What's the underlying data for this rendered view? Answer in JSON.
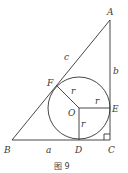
{
  "diagram": {
    "caption": "图 9",
    "points": {
      "A": {
        "label": "A",
        "x": 110,
        "y": 20
      },
      "B": {
        "label": "B",
        "x": 12,
        "y": 140
      },
      "C": {
        "label": "C",
        "x": 110,
        "y": 140
      },
      "D": {
        "label": "D",
        "x": 79,
        "y": 140
      },
      "E": {
        "label": "E",
        "x": 110,
        "y": 108
      },
      "F": {
        "label": "F",
        "x": 57,
        "y": 86
      },
      "O": {
        "label": "O",
        "x": 79,
        "y": 108
      }
    },
    "circle": {
      "center": "O",
      "radius": 31
    },
    "side_labels": {
      "a": "a",
      "b": "b",
      "c": "c"
    },
    "radius_labels": {
      "OF": "r",
      "OE": "r",
      "OD": "r"
    },
    "colors": {
      "stroke": "#333333",
      "text": "#3a3a3a"
    }
  }
}
